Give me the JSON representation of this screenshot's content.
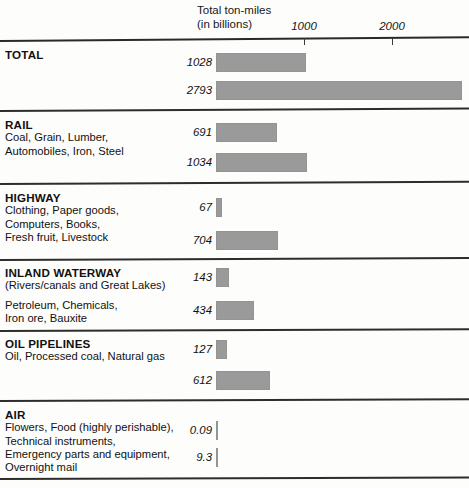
{
  "chart_data": {
    "type": "bar",
    "orientation": "horizontal",
    "title": "Total ton-miles",
    "subtitle": "(in billions)",
    "xlabel": "",
    "ylabel": "",
    "xlim": [
      0,
      2900
    ],
    "grid": false,
    "legend": "none",
    "axis_ticks": [
      {
        "value": 1000,
        "label": "1000"
      },
      {
        "value": 2000,
        "label": "2000"
      }
    ],
    "categories": [
      "TOTAL",
      "RAIL",
      "HIGHWAY",
      "INLAND WATERWAY",
      "OIL PIPELINES",
      "AIR"
    ],
    "series": [
      {
        "name": "first",
        "values": [
          1028,
          691,
          67,
          143,
          127,
          0.09
        ]
      },
      {
        "name": "second",
        "values": [
          2793,
          1034,
          704,
          434,
          612,
          9.3
        ]
      }
    ],
    "sections": [
      {
        "title": "TOTAL",
        "subtitle": "",
        "bars": [
          {
            "value": 1028,
            "label": "1028"
          },
          {
            "value": 2793,
            "label": "2793"
          }
        ]
      },
      {
        "title": "RAIL",
        "subtitle": "Coal, Grain, Lumber,\nAutomobiles, Iron, Steel",
        "bars": [
          {
            "value": 691,
            "label": "691"
          },
          {
            "value": 1034,
            "label": "1034"
          }
        ]
      },
      {
        "title": "HIGHWAY",
        "subtitle": "Clothing, Paper goods,\nComputers, Books,\nFresh fruit, Livestock",
        "bars": [
          {
            "value": 67,
            "label": "67"
          },
          {
            "value": 704,
            "label": "704"
          }
        ]
      },
      {
        "title": "INLAND WATERWAY",
        "subtitle": "(Rivers/canals and Great Lakes)",
        "subtitle2": "Petroleum, Chemicals,\nIron ore, Bauxite",
        "bars": [
          {
            "value": 143,
            "label": "143"
          },
          {
            "value": 434,
            "label": "434"
          }
        ]
      },
      {
        "title": "OIL PIPELINES",
        "subtitle": "Oil, Processed coal, Natural gas",
        "bars": [
          {
            "value": 127,
            "label": "127"
          },
          {
            "value": 612,
            "label": "612"
          }
        ]
      },
      {
        "title": "AIR",
        "subtitle": "Flowers, Food (highly perishable),\nTechnical instruments,\nEmergency parts and equipment,\nOvernight mail",
        "bars": [
          {
            "value": 0.09,
            "label": "0.09"
          },
          {
            "value": 9.3,
            "label": "9.3"
          }
        ]
      }
    ],
    "colors": {
      "bar_fill": "#9a9a9a",
      "text": "#141414",
      "rule": "#2d2d2d",
      "background": "#fdfdfb"
    }
  }
}
